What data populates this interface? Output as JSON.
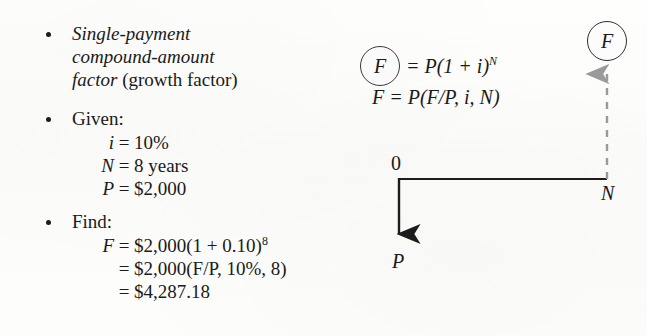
{
  "page": {
    "background_color": "#fdfdfb",
    "ink_color": "#1a1a1a",
    "dashed_arrow_color": "#9a9a9a"
  },
  "bullets": [
    {
      "marker": "bullet-dot",
      "lines": [
        {
          "italic_part": "Single-payment",
          "plain_part": ""
        },
        {
          "italic_part": "compound-amount",
          "plain_part": ""
        },
        {
          "italic_part": "factor",
          "plain_part": " (growth factor)"
        }
      ]
    },
    {
      "marker": "bullet-dot",
      "heading": "Given:",
      "equations": [
        {
          "lhs": "i",
          "eq": "=",
          "rhs": "10%"
        },
        {
          "lhs": "N",
          "eq": "=",
          "rhs": "8 years"
        },
        {
          "lhs": "P",
          "eq": "=",
          "rhs": "$2,000"
        }
      ]
    },
    {
      "marker": "bullet-dot",
      "heading": "Find:",
      "equations": [
        {
          "lhs": "F",
          "eq": "=",
          "rhs": "$2,000(1 + 0.10)",
          "exponent": "8"
        },
        {
          "lhs": "",
          "eq": "=",
          "rhs": "$2,000(F/P, 10%, 8)",
          "exponent": ""
        },
        {
          "lhs": "",
          "eq": "=",
          "rhs": "$4,287.18",
          "exponent": ""
        }
      ]
    }
  ],
  "formula": {
    "circled_symbol": "F",
    "row1_rest": "= P(1 + i)",
    "row1_exponent": "N",
    "row2": "F  =  P(F/P, i, N)"
  },
  "diagram": {
    "future_value_label": "F",
    "time_zero_label": "0",
    "period_end_label": "N",
    "present_value_label": "P"
  }
}
